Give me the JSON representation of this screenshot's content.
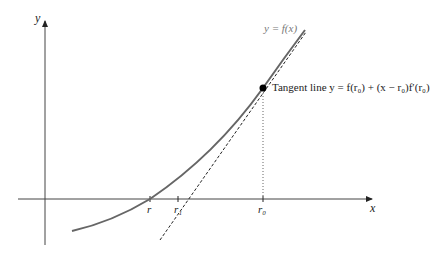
{
  "figure": {
    "type": "diagram",
    "axes": {
      "x_label": "x",
      "y_label": "y"
    },
    "curve_label": "y = f(x)",
    "tangent_label": "Tangent line y = f(r₀) + (x − r₀)f′(r₀)",
    "tick_labels": {
      "r": "r",
      "r1": "r₁",
      "r0": "r₀"
    },
    "colors": {
      "curve": "#555555",
      "axes": "#333333",
      "tangent": "#222222",
      "point": "#000000"
    }
  }
}
